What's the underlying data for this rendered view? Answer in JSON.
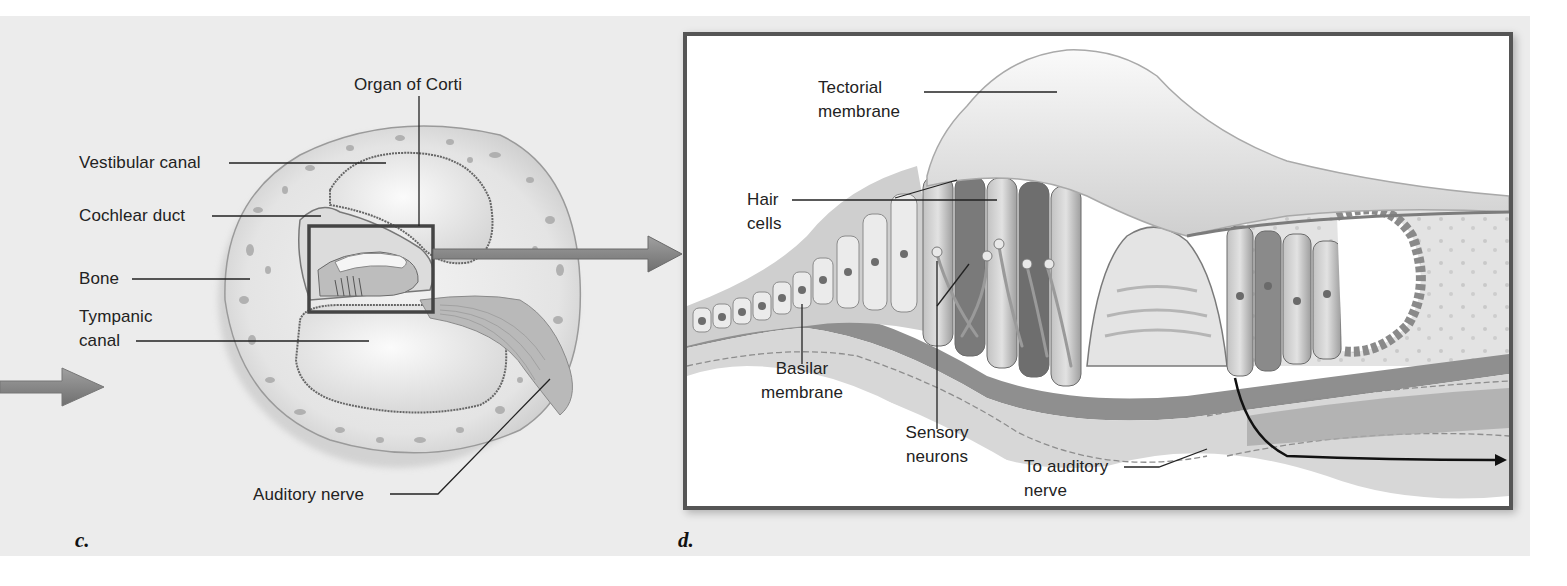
{
  "figure": {
    "panels": [
      {
        "id": "c",
        "letter": "c.",
        "title": "Cochlea cross-section",
        "labels": {
          "organ_of_corti": "Organ of Corti",
          "vestibular_canal": "Vestibular canal",
          "cochlear_duct": "Cochlear duct",
          "bone": "Bone",
          "tympanic_canal_1": "Tympanic",
          "tympanic_canal_2": "canal",
          "auditory_nerve": "Auditory nerve"
        }
      },
      {
        "id": "d",
        "letter": "d.",
        "title": "Organ of Corti enlarged",
        "labels": {
          "tectorial_1": "Tectorial",
          "tectorial_2": "membrane",
          "hair_1": "Hair",
          "hair_2": "cells",
          "basilar_1": "Basilar",
          "basilar_2": "membrane",
          "sensory_1": "Sensory",
          "sensory_2": "neurons",
          "to_auditory_1": "To auditory",
          "to_auditory_2": "nerve"
        }
      }
    ],
    "colors": {
      "background": "#ececec",
      "frame": "#555555",
      "arrow": "#8a8a8a",
      "leader_line": "#222222",
      "tissue_light": "#d9d9d9",
      "tissue_mid": "#a8a8a8",
      "tissue_dark": "#6e6e6e"
    }
  }
}
